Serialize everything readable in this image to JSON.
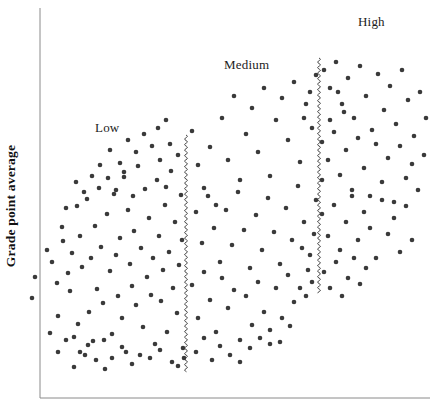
{
  "figure": {
    "width": 445,
    "height": 412,
    "background": "#ffffff",
    "dot_color": "#3a3a3a",
    "axis_color": "#8a8a8a",
    "divider_color": "#333333"
  },
  "labels": {
    "y_axis_title": "Grade point average",
    "low": "Low",
    "medium": "Medium",
    "high": "High"
  },
  "chart_data": {
    "type": "scatter",
    "title": "",
    "xlabel": "",
    "ylabel": "Grade point average",
    "grid": false,
    "legend": null,
    "axes": {
      "x_axis": {
        "x_start": 40,
        "x_end": 430,
        "y": 398,
        "ticks": [],
        "tick_labels": []
      },
      "y_axis": {
        "y_start": 8,
        "y_end": 398,
        "x": 40,
        "ticks": [],
        "tick_labels": []
      }
    },
    "annotations": [
      {
        "text": "Low",
        "x": 100,
        "y": 128
      },
      {
        "text": "Medium",
        "x": 228,
        "y": 65
      },
      {
        "text": "High",
        "x": 360,
        "y": 22
      }
    ],
    "dividers": [
      {
        "name": "low-medium-divider",
        "x": 186,
        "y_top": 135,
        "y_bottom": 372,
        "style": "wavy"
      },
      {
        "name": "medium-high-divider",
        "x": 319,
        "y_top": 58,
        "y_bottom": 294,
        "style": "wavy"
      }
    ],
    "groups": [
      "Low",
      "Medium",
      "High"
    ],
    "dot_radius": 2.3,
    "points": [
      [
        35,
        277
      ],
      [
        32,
        298
      ],
      [
        47,
        250
      ],
      [
        52,
        262
      ],
      [
        57,
        283
      ],
      [
        58,
        316
      ],
      [
        62,
        227
      ],
      [
        63,
        241
      ],
      [
        66,
        208
      ],
      [
        68,
        273
      ],
      [
        70,
        291
      ],
      [
        72,
        253
      ],
      [
        74,
        337
      ],
      [
        77,
        206
      ],
      [
        78,
        324
      ],
      [
        80,
        236
      ],
      [
        82,
        267
      ],
      [
        85,
        355
      ],
      [
        87,
        199
      ],
      [
        89,
        312
      ],
      [
        91,
        258
      ],
      [
        93,
        341
      ],
      [
        95,
        226
      ],
      [
        97,
        289
      ],
      [
        99,
        188
      ],
      [
        101,
        247
      ],
      [
        103,
        303
      ],
      [
        105,
        369
      ],
      [
        107,
        214
      ],
      [
        110,
        271
      ],
      [
        112,
        334
      ],
      [
        114,
        194
      ],
      [
        116,
        255
      ],
      [
        118,
        296
      ],
      [
        120,
        238
      ],
      [
        122,
        318
      ],
      [
        124,
        177
      ],
      [
        126,
        352
      ],
      [
        128,
        210
      ],
      [
        130,
        264
      ],
      [
        132,
        286
      ],
      [
        134,
        231
      ],
      [
        136,
        305
      ],
      [
        138,
        166
      ],
      [
        141,
        248
      ],
      [
        143,
        327
      ],
      [
        145,
        189
      ],
      [
        147,
        277
      ],
      [
        149,
        218
      ],
      [
        151,
        295
      ],
      [
        153,
        258
      ],
      [
        155,
        344
      ],
      [
        157,
        180
      ],
      [
        159,
        236
      ],
      [
        161,
        301
      ],
      [
        163,
        270
      ],
      [
        165,
        205
      ],
      [
        167,
        332
      ],
      [
        169,
        252
      ],
      [
        171,
        171
      ],
      [
        173,
        288
      ],
      [
        175,
        222
      ],
      [
        177,
        313
      ],
      [
        179,
        265
      ],
      [
        181,
        195
      ],
      [
        183,
        348
      ],
      [
        178,
        155
      ],
      [
        170,
        144
      ],
      [
        166,
        187
      ],
      [
        160,
        160
      ],
      [
        182,
        240
      ],
      [
        184,
        358
      ],
      [
        178,
        366
      ],
      [
        172,
        362
      ],
      [
        160,
        350
      ],
      [
        150,
        358
      ],
      [
        140,
        355
      ],
      [
        132,
        364
      ],
      [
        122,
        347
      ],
      [
        112,
        358
      ],
      [
        104,
        340
      ],
      [
        96,
        360
      ],
      [
        88,
        345
      ],
      [
        80,
        352
      ],
      [
        74,
        367
      ],
      [
        66,
        340
      ],
      [
        58,
        352
      ],
      [
        50,
        333
      ],
      [
        110,
        150
      ],
      [
        120,
        163
      ],
      [
        128,
        140
      ],
      [
        136,
        152
      ],
      [
        144,
        134
      ],
      [
        152,
        146
      ],
      [
        158,
        128
      ],
      [
        166,
        120
      ],
      [
        92,
        176
      ],
      [
        84,
        192
      ],
      [
        76,
        182
      ],
      [
        100,
        165
      ],
      [
        108,
        178
      ],
      [
        116,
        190
      ],
      [
        124,
        172
      ],
      [
        133,
        196
      ],
      [
        192,
        131
      ],
      [
        198,
        165
      ],
      [
        204,
        188
      ],
      [
        210,
        147
      ],
      [
        216,
        205
      ],
      [
        222,
        118
      ],
      [
        228,
        160
      ],
      [
        234,
        96
      ],
      [
        240,
        180
      ],
      [
        246,
        134
      ],
      [
        252,
        108
      ],
      [
        258,
        152
      ],
      [
        264,
        88
      ],
      [
        270,
        176
      ],
      [
        276,
        120
      ],
      [
        282,
        98
      ],
      [
        288,
        140
      ],
      [
        294,
        82
      ],
      [
        300,
        162
      ],
      [
        306,
        104
      ],
      [
        312,
        128
      ],
      [
        316,
        75
      ],
      [
        310,
        92
      ],
      [
        304,
        118
      ],
      [
        196,
        212
      ],
      [
        202,
        243
      ],
      [
        208,
        196
      ],
      [
        214,
        228
      ],
      [
        220,
        262
      ],
      [
        226,
        210
      ],
      [
        232,
        245
      ],
      [
        238,
        192
      ],
      [
        244,
        230
      ],
      [
        250,
        268
      ],
      [
        256,
        215
      ],
      [
        262,
        250
      ],
      [
        268,
        198
      ],
      [
        274,
        232
      ],
      [
        280,
        264
      ],
      [
        286,
        208
      ],
      [
        292,
        240
      ],
      [
        298,
        186
      ],
      [
        304,
        222
      ],
      [
        310,
        255
      ],
      [
        316,
        200
      ],
      [
        314,
        234
      ],
      [
        308,
        270
      ],
      [
        302,
        248
      ],
      [
        192,
        285
      ],
      [
        198,
        318
      ],
      [
        204,
        272
      ],
      [
        210,
        300
      ],
      [
        216,
        332
      ],
      [
        222,
        278
      ],
      [
        228,
        308
      ],
      [
        234,
        290
      ],
      [
        240,
        340
      ],
      [
        246,
        296
      ],
      [
        252,
        325
      ],
      [
        258,
        282
      ],
      [
        264,
        312
      ],
      [
        270,
        344
      ],
      [
        276,
        288
      ],
      [
        282,
        318
      ],
      [
        288,
        275
      ],
      [
        294,
        302
      ],
      [
        300,
        288
      ],
      [
        306,
        296
      ],
      [
        312,
        282
      ],
      [
        196,
        352
      ],
      [
        204,
        338
      ],
      [
        212,
        360
      ],
      [
        220,
        346
      ],
      [
        230,
        355
      ],
      [
        240,
        362
      ],
      [
        250,
        348
      ],
      [
        260,
        338
      ],
      [
        270,
        330
      ],
      [
        280,
        342
      ],
      [
        290,
        326
      ],
      [
        324,
        70
      ],
      [
        330,
        88
      ],
      [
        336,
        62
      ],
      [
        342,
        104
      ],
      [
        348,
        78
      ],
      [
        354,
        118
      ],
      [
        360,
        66
      ],
      [
        366,
        96
      ],
      [
        372,
        130
      ],
      [
        378,
        74
      ],
      [
        384,
        110
      ],
      [
        390,
        86
      ],
      [
        396,
        124
      ],
      [
        402,
        70
      ],
      [
        408,
        100
      ],
      [
        414,
        136
      ],
      [
        420,
        92
      ],
      [
        426,
        118
      ],
      [
        322,
        142
      ],
      [
        328,
        160
      ],
      [
        334,
        132
      ],
      [
        340,
        175
      ],
      [
        346,
        150
      ],
      [
        352,
        190
      ],
      [
        358,
        138
      ],
      [
        364,
        168
      ],
      [
        370,
        196
      ],
      [
        376,
        144
      ],
      [
        382,
        182
      ],
      [
        388,
        158
      ],
      [
        394,
        202
      ],
      [
        400,
        146
      ],
      [
        406,
        178
      ],
      [
        412,
        164
      ],
      [
        418,
        190
      ],
      [
        424,
        155
      ],
      [
        322,
        214
      ],
      [
        328,
        236
      ],
      [
        334,
        205
      ],
      [
        340,
        250
      ],
      [
        346,
        222
      ],
      [
        352,
        196
      ],
      [
        358,
        240
      ],
      [
        364,
        212
      ],
      [
        370,
        228
      ],
      [
        376,
        258
      ],
      [
        382,
        200
      ],
      [
        388,
        234
      ],
      [
        394,
        218
      ],
      [
        400,
        252
      ],
      [
        406,
        206
      ],
      [
        412,
        240
      ],
      [
        324,
        272
      ],
      [
        330,
        288
      ],
      [
        336,
        262
      ],
      [
        342,
        296
      ],
      [
        348,
        278
      ],
      [
        354,
        258
      ],
      [
        360,
        284
      ],
      [
        366,
        268
      ],
      [
        322,
        180
      ],
      [
        330,
        120
      ],
      [
        338,
        92
      ],
      [
        344,
        112
      ]
    ]
  }
}
